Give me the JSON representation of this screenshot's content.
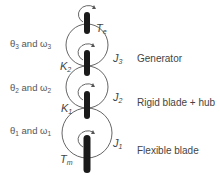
{
  "diagram": {
    "type": "three-mass drivetrain torsional model",
    "colors": {
      "line": "#666666",
      "shaft": "#1a1a1a",
      "text": "#444444"
    },
    "bodies": [
      {
        "id": "generator",
        "label": "Generator",
        "inertia": "J",
        "inertia_sub": "3",
        "angle_rate": {
          "theta": "θ",
          "sub": "3",
          "and": "and",
          "omega": "ω"
        }
      },
      {
        "id": "rigid-blade-hub",
        "label": "Rigid blade + hub",
        "inertia": "J",
        "inertia_sub": "2",
        "angle_rate": {
          "theta": "θ",
          "sub": "2",
          "and": "and",
          "omega": "ω"
        }
      },
      {
        "id": "flexible-blade",
        "label": "Flexible blade",
        "inertia": "J",
        "inertia_sub": "1",
        "angle_rate": {
          "theta": "θ",
          "sub": "1",
          "and": "and",
          "omega": "ω"
        }
      }
    ],
    "springs": [
      {
        "id": "K2",
        "symbol": "K",
        "sub": "2"
      },
      {
        "id": "K1",
        "symbol": "K",
        "sub": "1"
      }
    ],
    "torques": [
      {
        "id": "Te",
        "symbol": "T",
        "sub": "e"
      },
      {
        "id": "Tm",
        "symbol": "T",
        "sub": "m"
      }
    ]
  }
}
